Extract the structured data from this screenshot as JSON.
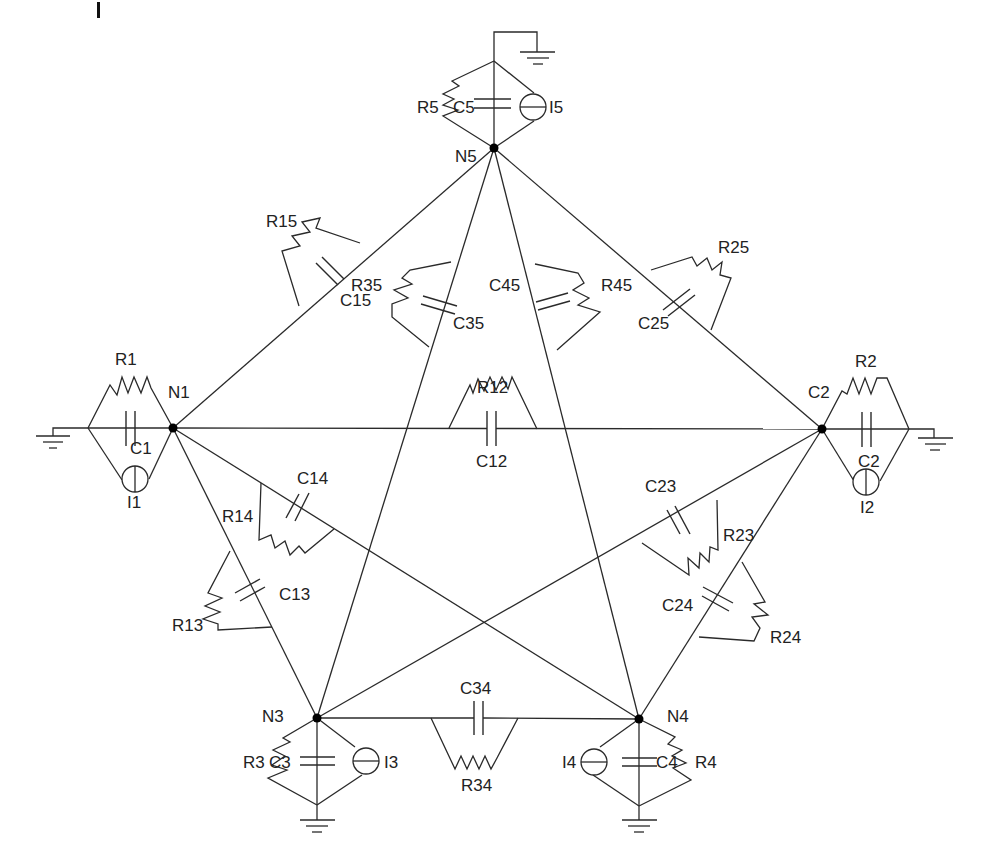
{
  "diagram": {
    "colors": {
      "wire": "#2a2a2a",
      "node": "#000000",
      "text": "#222222",
      "background": "#ffffff"
    },
    "nodes": [
      {
        "id": "N5",
        "label": "N5",
        "x": 494,
        "y": 148,
        "label_x": 455,
        "label_y": 162
      },
      {
        "id": "N1",
        "label": "N1",
        "x": 173,
        "label_x": 178,
        "y": 428,
        "label_y": 392
      },
      {
        "id": "N2",
        "label": "C2",
        "x": 822,
        "y": 429,
        "label_x": 808,
        "label_y": 392
      },
      {
        "id": "N3",
        "label": "N3",
        "x": 317,
        "y": 718,
        "label_x": 262,
        "label_y": 724
      },
      {
        "id": "N4",
        "label": "N4",
        "x": 639,
        "y": 719,
        "label_x": 668,
        "label_y": 724
      }
    ],
    "branches": [
      {
        "from": "N1",
        "to": "N5",
        "capacitor": "C15",
        "resistor": "R15"
      },
      {
        "from": "N2",
        "to": "N5",
        "capacitor": "C25",
        "resistor": "R25"
      },
      {
        "from": "N3",
        "to": "N5",
        "capacitor": "C35",
        "resistor": "R35"
      },
      {
        "from": "N4",
        "to": "N5",
        "capacitor": "C45",
        "resistor": "R45"
      },
      {
        "from": "N1",
        "to": "N2",
        "capacitor": "C12",
        "resistor": "R12"
      },
      {
        "from": "N1",
        "to": "N3",
        "capacitor": "C13",
        "resistor": "R13"
      },
      {
        "from": "N1",
        "to": "N4",
        "capacitor": "C14",
        "resistor": "R14"
      },
      {
        "from": "N2",
        "to": "N3",
        "capacitor": "C23",
        "resistor": "R23"
      },
      {
        "from": "N2",
        "to": "N4",
        "capacitor": "C24",
        "resistor": "R24"
      },
      {
        "from": "N3",
        "to": "N4",
        "capacitor": "C34",
        "resistor": "R34"
      }
    ],
    "ground_branches": [
      {
        "node": "N1",
        "resistor": "R1",
        "capacitor": "C1",
        "source": "I1"
      },
      {
        "node": "N2",
        "resistor": "R2",
        "capacitor": "C2",
        "source": "I2"
      },
      {
        "node": "N3",
        "resistor": "R3",
        "capacitor": "C3",
        "source": "I3"
      },
      {
        "node": "N4",
        "resistor": "R4",
        "capacitor": "C4",
        "source": "I4"
      },
      {
        "node": "N5",
        "resistor": "R5",
        "capacitor": "C5",
        "source": "I5"
      }
    ],
    "labels": {
      "N5": "N5",
      "N1": "N1",
      "N2": "C2",
      "N3": "N3",
      "N4": "N4",
      "R5": "R5",
      "C5": "C5",
      "I5": "I5",
      "R1": "R1",
      "C1": "C1",
      "I1": "I1",
      "R2": "R2",
      "C2": "C2",
      "I2": "I2",
      "R3": "R3",
      "C3": "C3",
      "I3": "I3",
      "R4": "R4",
      "C4": "C4",
      "I4": "I4",
      "R15": "R15",
      "C15": "C15",
      "R25": "R25",
      "C25": "C25",
      "R35": "R35",
      "C35": "C35",
      "R45": "R45",
      "C45": "C45",
      "R12": "R12",
      "C12": "C12",
      "R13": "R13",
      "C13": "C13",
      "R14": "R14",
      "C14": "C14",
      "R23": "R23",
      "C23": "C23",
      "R24": "R24",
      "C24": "C24",
      "R34": "R34",
      "C34": "C34"
    }
  }
}
